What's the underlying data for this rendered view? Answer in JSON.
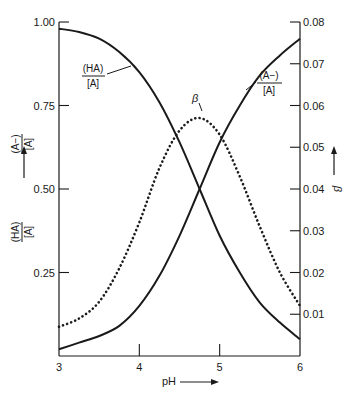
{
  "chart_data": {
    "type": "line",
    "title": "",
    "xlabel": "pH",
    "ylabel_left": [
      "(A−)/[A]",
      "(HA)/[A]"
    ],
    "ylabel_right": "β",
    "xlim": [
      3,
      6
    ],
    "ylim_left": [
      0,
      1.0
    ],
    "ylim_right": [
      0,
      0.08
    ],
    "x_ticks": [
      "3",
      "4",
      "5",
      "6"
    ],
    "y_ticks_left": [
      "1.00",
      "0.75",
      "0.50",
      "0.25"
    ],
    "y_ticks_right": [
      "0.08",
      "0.07",
      "0.06",
      "0.05",
      "0.04",
      "0.03",
      "0.02",
      "0.01"
    ],
    "grid": false,
    "x": [
      3.0,
      3.25,
      3.5,
      3.75,
      4.0,
      4.25,
      4.5,
      4.75,
      5.0,
      5.25,
      5.5,
      5.75,
      6.0
    ],
    "series": [
      {
        "name": "(HA)/[A]",
        "axis": "left",
        "style": "solid",
        "values": [
          0.98,
          0.97,
          0.95,
          0.91,
          0.85,
          0.76,
          0.64,
          0.5,
          0.36,
          0.25,
          0.16,
          0.1,
          0.05
        ]
      },
      {
        "name": "(A−)/[A]",
        "axis": "left",
        "style": "solid",
        "values": [
          0.02,
          0.04,
          0.06,
          0.09,
          0.15,
          0.24,
          0.36,
          0.5,
          0.64,
          0.75,
          0.84,
          0.9,
          0.95
        ]
      },
      {
        "name": "β",
        "axis": "right",
        "style": "dotted",
        "values": [
          0.007,
          0.009,
          0.013,
          0.021,
          0.032,
          0.045,
          0.054,
          0.057,
          0.053,
          0.043,
          0.031,
          0.02,
          0.012
        ]
      }
    ],
    "annotations": [
      {
        "text": "(HA)/[A]",
        "target": "(HA)/[A] curve",
        "near_x": 3.7,
        "near_y": 0.86
      },
      {
        "text": "(A−)/[A]",
        "target": "(A−)/[A] curve",
        "near_x": 5.6,
        "near_y": 0.86
      },
      {
        "text": "β",
        "target": "β peak",
        "near_x": 4.6,
        "near_y": 0.061
      }
    ]
  },
  "labels": {
    "x_axis": "pH",
    "right_axis": "β",
    "left_top_num": "(A−)",
    "left_top_den": "[A]",
    "left_bot_num": "(HA)",
    "left_bot_den": "[A]",
    "ha_num": "(HA)",
    "ha_den": "[A]",
    "a_num": "(A−)",
    "a_den": "[A]",
    "beta": "β"
  }
}
